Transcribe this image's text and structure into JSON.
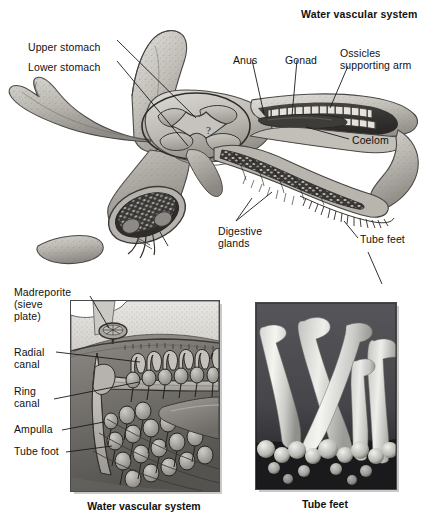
{
  "figure": {
    "title_top_right": "Water vascular system",
    "background_color": "#ffffff",
    "ink_color": "#111111"
  },
  "main_diagram": {
    "name": "sea-star-cutaway-illustration",
    "subject": "sea star (starfish) internal anatomy cutaway",
    "labels": [
      {
        "id": "upper-stomach",
        "text": "Upper stomach",
        "x": 28,
        "y": 42
      },
      {
        "id": "lower-stomach",
        "text": "Lower stomach",
        "x": 28,
        "y": 62
      },
      {
        "id": "anus",
        "text": "Anus",
        "x": 233,
        "y": 55
      },
      {
        "id": "gonad",
        "text": "Gonad",
        "x": 285,
        "y": 55
      },
      {
        "id": "ossicles-line1",
        "text": "Ossicles",
        "x": 340,
        "y": 48
      },
      {
        "id": "ossicles-line2",
        "text": "supporting arm",
        "x": 340,
        "y": 60
      },
      {
        "id": "coelom",
        "text": "Coelom",
        "x": 352,
        "y": 141
      },
      {
        "id": "digestive-line1",
        "text": "Digestive",
        "x": 218,
        "y": 226
      },
      {
        "id": "digestive-line2",
        "text": "glands",
        "x": 218,
        "y": 238
      },
      {
        "id": "tube-feet-main",
        "text": "Tube feet",
        "x": 360,
        "y": 240
      }
    ]
  },
  "left_panel": {
    "name": "water-vascular-system-panel",
    "caption": "Water vascular system",
    "labels": [
      {
        "id": "madreporite-line1",
        "text": "Madreporite",
        "x": 14,
        "y": 287
      },
      {
        "id": "madreporite-line2",
        "text": "(sieve",
        "x": 14,
        "y": 299
      },
      {
        "id": "madreporite-line3",
        "text": "plate)",
        "x": 14,
        "y": 311
      },
      {
        "id": "radial-canal-line1",
        "text": "Radial",
        "x": 14,
        "y": 347
      },
      {
        "id": "radial-canal-line2",
        "text": "canal",
        "x": 14,
        "y": 359
      },
      {
        "id": "ring-canal-line1",
        "text": "Ring",
        "x": 14,
        "y": 386
      },
      {
        "id": "ring-canal-line2",
        "text": "canal",
        "x": 14,
        "y": 398
      },
      {
        "id": "ampulla",
        "text": "Ampulla",
        "x": 14,
        "y": 427
      },
      {
        "id": "tube-foot",
        "text": "Tube foot",
        "x": 14,
        "y": 449
      }
    ]
  },
  "right_panel": {
    "name": "tube-feet-micrograph-panel",
    "caption": "Tube feet",
    "subject": "scanning electron micrograph of sea star tube feet"
  }
}
